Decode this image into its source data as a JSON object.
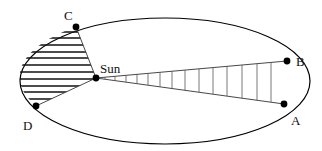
{
  "diagram": {
    "orbit": {
      "cx": 165,
      "cy": 81,
      "rx": 145,
      "ry": 63,
      "stroke": "#000000"
    },
    "sun": {
      "label": "Sun",
      "x": 96,
      "y": 78,
      "label_x": 100,
      "label_y": 73
    },
    "points": [
      {
        "id": "C",
        "label": "C",
        "x": 76,
        "y": 27,
        "label_x": 64,
        "label_y": 17
      },
      {
        "id": "D",
        "label": "D",
        "x": 36,
        "y": 106,
        "label_x": 25,
        "label_y": 128
      },
      {
        "id": "B",
        "label": "B",
        "x": 287,
        "y": 61,
        "label_x": 296,
        "label_y": 66
      },
      {
        "id": "A",
        "label": "A",
        "x": 284,
        "y": 104,
        "label_x": 292,
        "label_y": 124
      }
    ],
    "sectors": [
      {
        "id": "CD",
        "from": "C",
        "to": "D",
        "fill_style": "horizontal-hatch"
      },
      {
        "id": "AB",
        "from": "A",
        "to": "B",
        "fill_style": "vertical-hatch"
      }
    ]
  }
}
